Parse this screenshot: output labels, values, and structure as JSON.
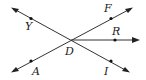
{
  "diagram": {
    "labels": {
      "Y": "Y",
      "F": "F",
      "R": "R",
      "D": "D",
      "A": "A",
      "I": "I"
    },
    "lines": [
      {
        "name": "line YI",
        "through": [
          "Y",
          "D",
          "I"
        ],
        "arrows": "both"
      },
      {
        "name": "line AF",
        "through": [
          "A",
          "D",
          "F"
        ],
        "arrows": "both"
      }
    ],
    "rays": [
      {
        "name": "ray DR",
        "from": "D",
        "through": "R"
      }
    ],
    "points": [
      "Y",
      "F",
      "R",
      "D",
      "A",
      "I"
    ],
    "colors": {
      "stroke": "#333333",
      "text": "#222222",
      "background": "#ffffff"
    }
  }
}
